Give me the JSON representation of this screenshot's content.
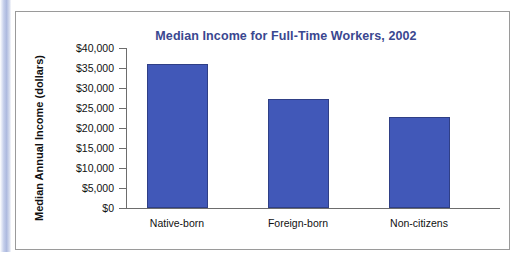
{
  "chart_data": {
    "type": "bar",
    "title": "Median Income for Full-Time Workers, 2002",
    "xlabel": "",
    "ylabel": "Median Annual Income (dollars)",
    "categories": [
      "Native-born",
      "Foreign-born",
      "Non-citizens"
    ],
    "values": [
      36000,
      27200,
      22800
    ],
    "ylim": [
      0,
      40000
    ],
    "ytick_step": 5000,
    "ytick_labels": [
      "$40,000",
      "$35,000",
      "$30,000",
      "$25,000",
      "$20,000",
      "$15,000",
      "$10,000",
      "$5,000",
      "$0"
    ],
    "ytick_values": [
      40000,
      35000,
      30000,
      25000,
      20000,
      15000,
      10000,
      5000,
      0
    ],
    "grid": false,
    "legend": false,
    "series": [
      {
        "name": "Median Annual Income",
        "values": [
          36000,
          27200,
          22800
        ]
      }
    ]
  },
  "style": {
    "bar_color": "#4158b8",
    "bar_border_color": "#2f3f86",
    "title_color": "#3a4790",
    "axis_color": "#6d6d6d",
    "text_color": "#111111",
    "frame_border_color": "#9a9a9a",
    "accent_stripe_color": "#aebadf",
    "background": "#ffffff"
  }
}
